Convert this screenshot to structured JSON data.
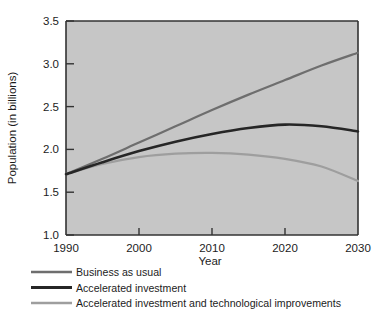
{
  "chart_data": {
    "type": "line",
    "title": "",
    "xlabel": "Year",
    "ylabel": "Population (in billions)",
    "xlim": [
      1990,
      2030
    ],
    "ylim": [
      1.0,
      3.5
    ],
    "grid": false,
    "legend_position": "below",
    "x_ticks": [
      "1990",
      "2000",
      "2010",
      "2020",
      "2030"
    ],
    "y_ticks": [
      "1.0",
      "1.5",
      "2.0",
      "2.5",
      "3.0",
      "3.5"
    ],
    "x": [
      1990,
      1995,
      2000,
      2005,
      2010,
      2015,
      2020,
      2025,
      2030
    ],
    "series": [
      {
        "name": "Business as usual",
        "color": "#6e6e6e",
        "values": [
          1.71,
          1.89,
          2.08,
          2.27,
          2.46,
          2.64,
          2.81,
          2.98,
          3.13
        ]
      },
      {
        "name": "Accelerated investment",
        "color": "#262626",
        "values": [
          1.71,
          1.85,
          1.98,
          2.09,
          2.18,
          2.25,
          2.29,
          2.27,
          2.21
        ]
      },
      {
        "name": "Accelerated investment and technological improvements",
        "color": "#9e9e9e",
        "values": [
          1.71,
          1.83,
          1.91,
          1.95,
          1.96,
          1.94,
          1.89,
          1.8,
          1.63
        ]
      }
    ]
  },
  "legend": {
    "items": [
      {
        "label": "Business as usual",
        "color": "#6e6e6e"
      },
      {
        "label": "Accelerated investment",
        "color": "#262626"
      },
      {
        "label": "Accelerated investment and technological improvements",
        "color": "#9e9e9e"
      }
    ]
  },
  "colors": {
    "plot_background": "#c6c6c6",
    "page_background": "#ffffff",
    "axis": "#333333",
    "text": "#1c1c1c"
  }
}
